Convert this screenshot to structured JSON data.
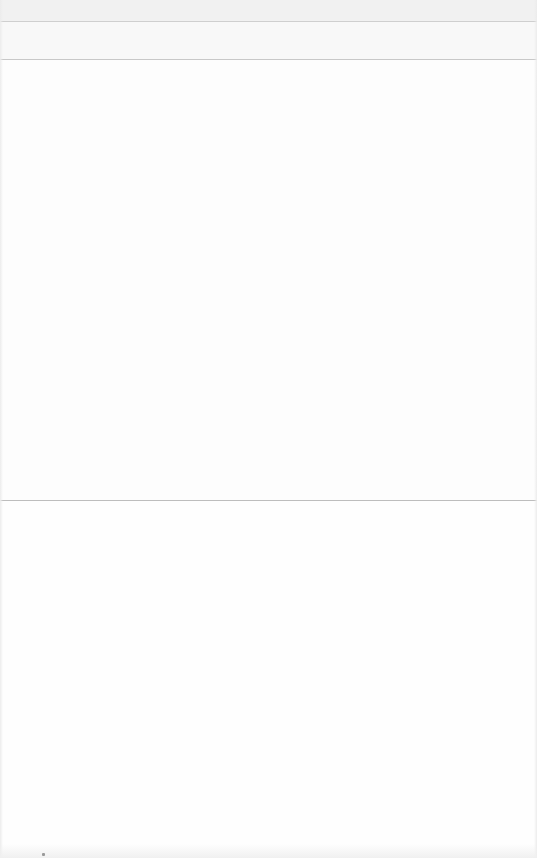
{
  "screen": {
    "state": "blank",
    "colors": {
      "top_band": "#f1f1f1",
      "sub_band": "#f8f8f8",
      "content": "#fdfdfd",
      "divider": "#bdbdbd"
    }
  }
}
